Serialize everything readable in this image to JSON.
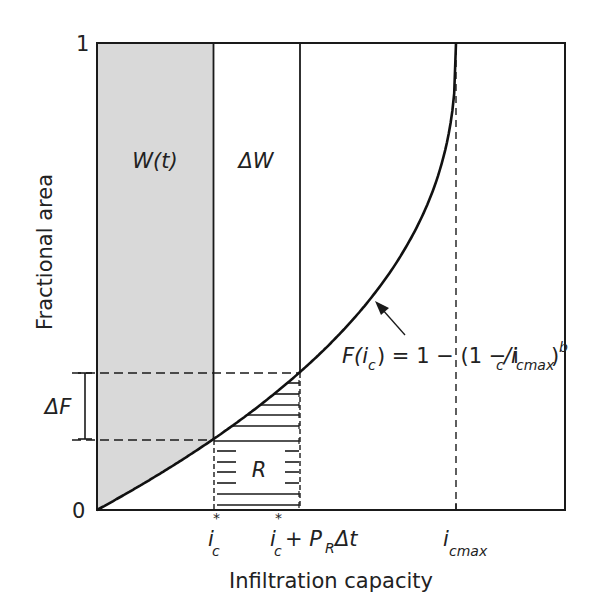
{
  "figure": {
    "y_axis_label": "Fractional area",
    "x_axis_label": "Infiltration capacity",
    "y_ticks": [
      "0",
      "1"
    ],
    "regions": {
      "w_t": "W(t)",
      "delta_w": "ΔW",
      "r": "R",
      "delta_f": "ΔF"
    },
    "x_ticks": {
      "ic_star_main": "i",
      "ic_star_sub": "c",
      "ic_star_sup": "*",
      "ic_plus_main": "i",
      "ic_plus_sub": "c",
      "ic_plus_sup": "*",
      "ic_plus_rest": "+ P",
      "ic_plus_pr_sub": "R",
      "ic_plus_dt": "Δt",
      "icmax_main": "i",
      "icmax_sub": "cmax"
    },
    "formula": {
      "f": "F(i",
      "f_sub": "c",
      "mid": ") = 1 − (1 − i",
      "mid_sub": "c",
      "slash": "/i",
      "slash_sub": "cmax",
      "close": ")",
      "exp": "b"
    },
    "colors": {
      "shade": "#d9d9d9",
      "line": "#1a1a1a"
    },
    "curve_exponent_b": 0.42
  }
}
